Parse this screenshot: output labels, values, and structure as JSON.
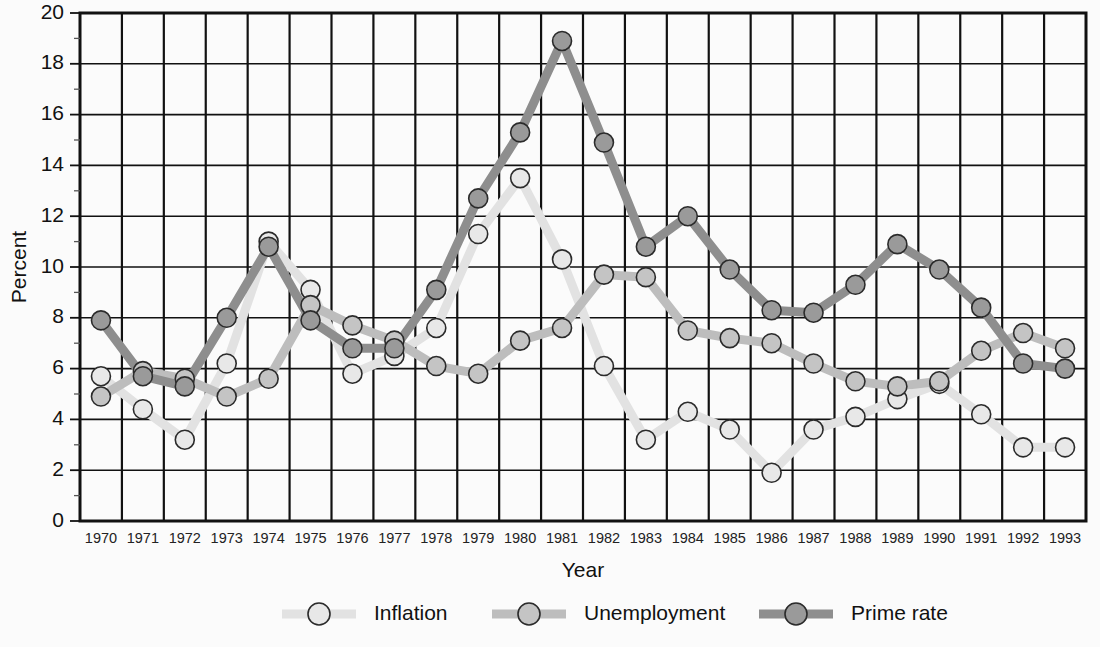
{
  "chart_data": {
    "type": "line",
    "title": "",
    "xlabel": "Year",
    "ylabel": "Percent",
    "ylim": [
      0,
      20
    ],
    "ytick_step": 2,
    "yticks": [
      0,
      2,
      4,
      6,
      8,
      10,
      12,
      14,
      16,
      18,
      20
    ],
    "ytick_labels": [
      "0",
      "2",
      "4",
      "6",
      "8",
      "10",
      "12",
      "14",
      "16",
      "18",
      "20"
    ],
    "grid": "both",
    "legend_position": "bottom",
    "minor_tick_count": 1,
    "categories": [
      1970,
      1971,
      1972,
      1973,
      1974,
      1975,
      1976,
      1977,
      1978,
      1979,
      1980,
      1981,
      1982,
      1983,
      1984,
      1985,
      1986,
      1987,
      1988,
      1989,
      1990,
      1991,
      1992,
      1993
    ],
    "xtick_labels": [
      "1970",
      "1971",
      "1972",
      "1973",
      "1974",
      "1975",
      "1976",
      "1977",
      "1978",
      "1979",
      "1980",
      "1981",
      "1982",
      "1983",
      "1984",
      "1985",
      "1986",
      "1987",
      "1988",
      "1989",
      "1990",
      "1991",
      "1992",
      "1993"
    ],
    "series": [
      {
        "name": "Inflation",
        "color": "#e2e2e2",
        "marker_color": "#e8e8e8",
        "values": [
          5.7,
          4.4,
          3.2,
          6.2,
          11.0,
          9.1,
          5.8,
          6.5,
          7.6,
          11.3,
          13.5,
          10.3,
          6.1,
          3.2,
          4.3,
          3.6,
          1.9,
          3.6,
          4.1,
          4.8,
          5.4,
          4.2,
          2.9,
          2.9
        ]
      },
      {
        "name": "Unemployment",
        "color": "#bdbdbd",
        "marker_color": "#c4c4c4",
        "values": [
          4.9,
          5.9,
          5.6,
          4.9,
          5.6,
          8.5,
          7.7,
          7.1,
          6.1,
          5.8,
          7.1,
          7.6,
          9.7,
          9.6,
          7.5,
          7.2,
          7.0,
          6.2,
          5.5,
          5.3,
          5.5,
          6.7,
          7.4,
          6.8
        ]
      },
      {
        "name": "Prime rate",
        "color": "#8e8e8e",
        "marker_color": "#9a9a9a",
        "values": [
          7.9,
          5.7,
          5.3,
          8.0,
          10.8,
          7.9,
          6.8,
          6.8,
          9.1,
          12.7,
          15.3,
          18.9,
          14.9,
          10.8,
          12.0,
          9.9,
          8.3,
          8.2,
          9.3,
          10.9,
          9.9,
          8.4,
          6.2,
          6.0
        ]
      }
    ],
    "legend": [
      {
        "label": "Inflation",
        "color": "#e2e2e2",
        "marker_color": "#e8e8e8"
      },
      {
        "label": "Unemployment",
        "color": "#bdbdbd",
        "marker_color": "#c4c4c4"
      },
      {
        "label": "Prime rate",
        "color": "#8e8e8e",
        "marker_color": "#9a9a9a"
      }
    ]
  }
}
